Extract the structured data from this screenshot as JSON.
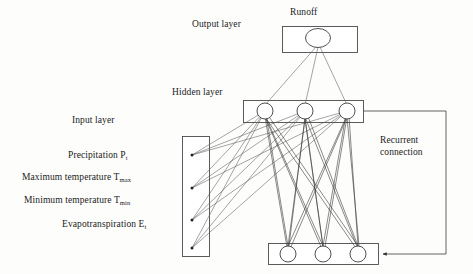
{
  "diagram": {
    "labels": {
      "output_layer": "Output layer",
      "hidden_layer": "Hidden layer",
      "input_layer": "Input layer",
      "runoff": "Runoff",
      "recurrent_connection_line1": "Recurrent",
      "recurrent_connection_line2": "connection"
    },
    "inputs": [
      {
        "name": "precipitation",
        "text": "Precipitation P",
        "subscript": "t"
      },
      {
        "name": "maximum-temperature",
        "text": "Maximum temperature T",
        "subscript": "max"
      },
      {
        "name": "minimum-temperature",
        "text": "Minimum temperature T",
        "subscript": "min"
      },
      {
        "name": "evapotranspiration",
        "text": "Evapotranspiration E",
        "subscript": "t"
      }
    ],
    "layers": {
      "input": {
        "node_count": 4,
        "node_style": "dot"
      },
      "hidden": {
        "node_count": 3,
        "node_style": "circle"
      },
      "context": {
        "node_count": 3,
        "node_style": "circle"
      },
      "output": {
        "node_count": 1,
        "node_style": "ellipse"
      }
    },
    "colors": {
      "background": "#fdfdfb",
      "stroke": "#4a4a4a",
      "link": "#5a5a5a",
      "text": "#1b1b1b",
      "node_fill": "#ffffff"
    }
  }
}
